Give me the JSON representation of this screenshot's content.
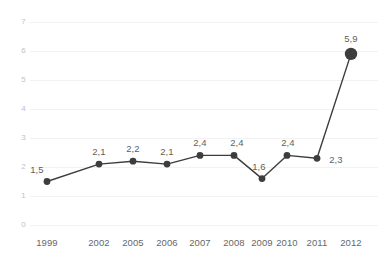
{
  "chart_data": {
    "type": "line",
    "title": "",
    "subtitle": "",
    "xlabel": "",
    "ylabel": "",
    "categories": [
      "1999",
      "2002",
      "2005",
      "2006",
      "2007",
      "2008",
      "2009",
      "2010",
      "2011",
      "2012"
    ],
    "values": [
      1.5,
      2.1,
      2.2,
      2.1,
      2.4,
      2.4,
      1.6,
      2.4,
      2.3,
      5.9
    ],
    "point_labels": [
      "1,5",
      "2,1",
      "2,2",
      "2,1",
      "2,4",
      "2,4",
      "1,6",
      "2,4",
      "2,3",
      "5,9"
    ],
    "ylim": [
      0,
      7
    ],
    "ytick_labels": [
      "0",
      "1",
      "2",
      "3",
      "4",
      "5",
      "6",
      "7"
    ],
    "ytick_values": [
      0,
      1,
      2,
      3,
      4,
      5,
      6,
      7
    ],
    "grid": true,
    "grid_axis": "y",
    "legend": "none",
    "decimal_separator": ",",
    "series": [
      {
        "name": "",
        "values": [
          1.5,
          2.1,
          2.2,
          2.1,
          2.4,
          2.4,
          1.6,
          2.4,
          2.3,
          5.9
        ]
      }
    ],
    "colors": {
      "line": "#3d3d3d",
      "marker": "#3d3d3d",
      "grid": "#f2f2f2",
      "value_label_text": "#5f5f5f",
      "xtick_text": "#676767",
      "ytick_text": "#c2c2c2",
      "background": "#ffffff"
    },
    "style": {
      "line_width": 1.4,
      "marker_radius": 3.4,
      "last_marker_radius": 6.2,
      "last_marker_emphasized": true
    },
    "geometry": {
      "x_positions": [
        47,
        99,
        133,
        167,
        200,
        234,
        262,
        287,
        317,
        351
      ],
      "y_baseline": 225,
      "y_top": 22,
      "unit_px": 29,
      "label_offsets": [
        {
          "dx": -10,
          "dy": -17
        },
        {
          "dx": 0,
          "dy": -17
        },
        {
          "dx": 0,
          "dy": -17
        },
        {
          "dx": 0,
          "dy": -17
        },
        {
          "dx": 0,
          "dy": -17
        },
        {
          "dx": 3,
          "dy": -17
        },
        {
          "dx": -3,
          "dy": -17
        },
        {
          "dx": 1,
          "dy": -17
        },
        {
          "dx": 19,
          "dy": -3
        },
        {
          "dx": 0,
          "dy": -20
        }
      ]
    }
  }
}
